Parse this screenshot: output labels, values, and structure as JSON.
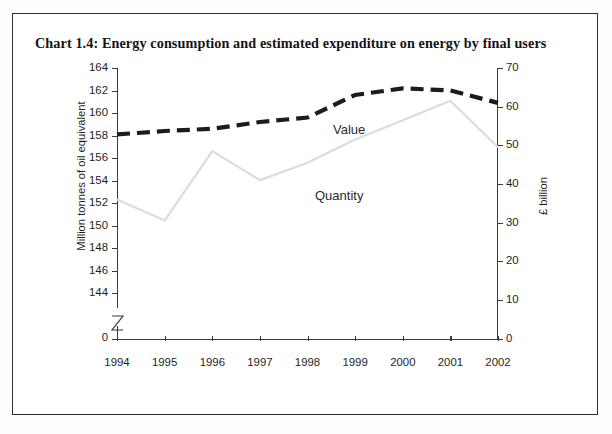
{
  "chart_title": "Chart 1.4: Energy consumption and estimated expenditure on energy by final users",
  "chart_data": {
    "type": "line",
    "title": "Chart 1.4: Energy consumption and estimated expenditure on energy by final users",
    "xlabel": "",
    "x": [
      "1994",
      "1995",
      "1996",
      "1997",
      "1998",
      "1999",
      "2000",
      "2001",
      "2002"
    ],
    "grid": false,
    "legend_position": "inline-annotation",
    "axes": {
      "left": {
        "label": "Million tonnes of oil equivalent",
        "ticks": [
          "164",
          "162",
          "160",
          "158",
          "156",
          "154",
          "152",
          "150",
          "148",
          "146",
          "144",
          "0"
        ],
        "tick_values": [
          164,
          162,
          160,
          158,
          156,
          154,
          152,
          150,
          148,
          146,
          144,
          0
        ],
        "ylim": [
          144,
          164
        ],
        "axis_break": true,
        "break_label": "0"
      },
      "right": {
        "label": "£ billion",
        "ticks": [
          "70",
          "60",
          "50",
          "40",
          "30",
          "20",
          "10",
          "0"
        ],
        "tick_values": [
          70,
          60,
          50,
          40,
          30,
          20,
          10,
          0
        ],
        "ylim": [
          0,
          70
        ],
        "axis_break": false
      }
    },
    "series": [
      {
        "name": "Quantity",
        "axis": "left",
        "unit": "Million tonnes of oil equivalent",
        "style": "dashed-thick-dark",
        "color": "#1c1c1c",
        "values": [
          158.1,
          158.4,
          158.6,
          159.2,
          159.6,
          161.6,
          162.2,
          162.0,
          160.9
        ]
      },
      {
        "name": "Value",
        "axis": "right",
        "unit": "£ billion",
        "style": "solid-thin-light",
        "color": "#dcdcdc",
        "values": [
          36.0,
          30.5,
          48.5,
          41.0,
          45.5,
          51.5,
          56.5,
          61.5,
          49.5
        ]
      }
    ],
    "annotations": [
      {
        "text": "Value",
        "x_pixel": 333,
        "y_pixel": 122
      },
      {
        "text": "Quantity",
        "x_pixel": 315,
        "y_pixel": 188
      }
    ]
  }
}
